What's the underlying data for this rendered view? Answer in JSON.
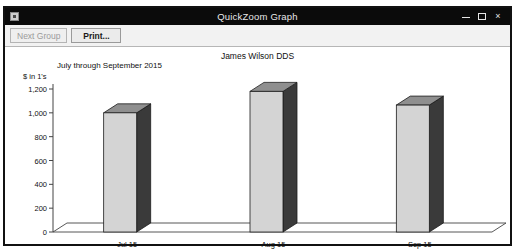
{
  "window": {
    "title": "QuickZoom Graph",
    "icon": "app-icon",
    "minimize_label": "",
    "maximize_label": "",
    "close_label": "×"
  },
  "toolbar": {
    "next_group_label": "Next Group",
    "next_group_enabled": false,
    "print_label": "Print...",
    "print_enabled": true
  },
  "chart_data": {
    "type": "bar",
    "title": "James Wilson DDS",
    "subtitle": "July through September 2015",
    "ylabel": "$ in 1's",
    "xlabel": "",
    "categories": [
      "Jul 15",
      "Aug 15",
      "Sep 15"
    ],
    "values": [
      1000,
      1180,
      1065
    ],
    "ylim": [
      0,
      1200
    ],
    "yticks": [
      "0",
      "200",
      "400",
      "600",
      "800",
      "1,000",
      "1,200"
    ],
    "ytick_values": [
      0,
      200,
      400,
      600,
      800,
      1000,
      1200
    ],
    "grid": false,
    "legend": "none",
    "style": "3d-bars",
    "bar_face_color": "#d4d4d4",
    "bar_side_color": "#3a3a3a",
    "bar_top_color": "#8f8f8f",
    "axis_color": "#444444"
  }
}
